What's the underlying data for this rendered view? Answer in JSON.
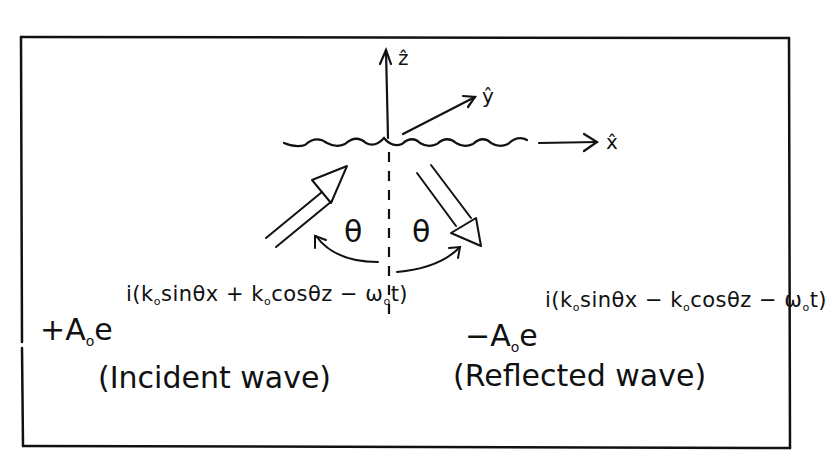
{
  "diagram": {
    "title": "",
    "axes": {
      "z_label": "ẑ",
      "y_label": "ŷ",
      "x_label": "x̂"
    },
    "angles": {
      "incident_angle_label": "θ",
      "reflected_angle_label": "θ"
    },
    "incident": {
      "sign": "+",
      "amplitude": "A",
      "amplitude_sub": "o",
      "base": "e",
      "exponent": {
        "prefix": "i(k",
        "k_sub": "o",
        "part1": "sinθx + k",
        "k2_sub": "o",
        "part2": "cosθz − ω",
        "w_sub": "o",
        "suffix": "t)"
      },
      "caption": "(Incident wave)"
    },
    "reflected": {
      "sign": "−",
      "amplitude": "A",
      "amplitude_sub": "o",
      "base": "e",
      "exponent": {
        "prefix": "i(k",
        "k_sub": "o",
        "part1": "sinθx − k",
        "k2_sub": "o",
        "part2": "cosθz − ω",
        "w_sub": "o",
        "suffix": "t)"
      },
      "caption": "(Reflected wave)"
    },
    "colors": {
      "ink": "#111111",
      "background": "#ffffff"
    }
  }
}
